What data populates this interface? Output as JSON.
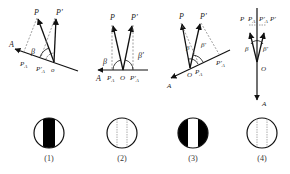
{
  "figure": {
    "panels": [
      {
        "id": "1",
        "caption": "(1)",
        "labels": {
          "P": "P",
          "P_prime": "P'",
          "A": "A",
          "PA": "P",
          "PA_sub": "A",
          "PA_prime": "P'",
          "PA_prime_sub": "A",
          "O": "o",
          "beta": "β"
        },
        "pattern": "dark-band"
      },
      {
        "id": "2",
        "caption": "(2)",
        "labels": {
          "P": "P",
          "P_prime": "P'",
          "A": "A",
          "PA": "P",
          "PA_sub": "A",
          "O": "O",
          "PA_prime": "P'",
          "PA_prime_sub": "A",
          "beta": "β",
          "beta_prime": "β'"
        },
        "pattern": "dashed-lines"
      },
      {
        "id": "3",
        "caption": "(3)",
        "labels": {
          "P": "P",
          "P_prime": "P'",
          "A": "A",
          "PA": "P",
          "PA_sub": "A",
          "O": "O",
          "PA_prime": "P'",
          "PA_prime_sub": "A",
          "beta": "β",
          "beta_prime": "β'"
        },
        "pattern": "light-band"
      },
      {
        "id": "4",
        "caption": "(4)",
        "labels": {
          "P": "P",
          "PA": "P",
          "PA_sub": "A",
          "PA_prime": "P'",
          "PA_prime_sub": "A",
          "P_prime": "P'",
          "beta": "β",
          "beta_prime": "β'",
          "O": "O",
          "A": "A"
        },
        "pattern": "dashed-lines"
      }
    ],
    "colors": {
      "ink": "#111111",
      "dashed": "#888888",
      "fill": "#000000",
      "background": "#ffffff"
    }
  }
}
